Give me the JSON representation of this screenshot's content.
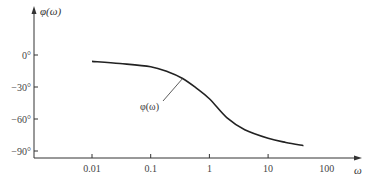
{
  "chart_data": {
    "type": "line",
    "title": "",
    "xlabel": "ω",
    "ylabel": "φ(ω)",
    "x_scale": "log",
    "x_ticks": [
      0.01,
      0.1,
      1,
      10
    ],
    "x_tick_labels": [
      "0.01",
      "0.1",
      "1",
      "10",
      "100"
    ],
    "x_tick_label_values": [
      0.01,
      0.1,
      1,
      10,
      100
    ],
    "xlim": [
      0.001,
      400
    ],
    "y_ticks": [
      0,
      -30,
      -60,
      -90
    ],
    "y_tick_labels": [
      "0°",
      "−30°",
      "−60°",
      "−90°"
    ],
    "ylim": [
      -95,
      40
    ],
    "grid": false,
    "series": [
      {
        "name": "φ(ω)",
        "x": [
          0.01,
          0.03,
          0.1,
          0.2,
          0.35,
          0.6,
          1,
          2,
          4,
          10,
          20,
          40
        ],
        "y": [
          -6,
          -8,
          -11,
          -16,
          -22,
          -31,
          -41,
          -59,
          -70,
          -78,
          -82,
          -85
        ]
      }
    ],
    "annotations": [
      {
        "text": "φ(ω)",
        "points_to": {
          "x": 0.35,
          "y": -22
        }
      }
    ]
  }
}
